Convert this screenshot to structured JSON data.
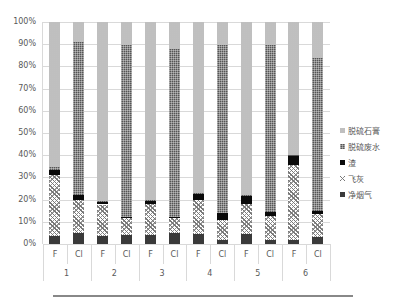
{
  "chart_data": {
    "type": "bar",
    "stacked": true,
    "percent": true,
    "title": "",
    "xlabel": "",
    "ylabel": "",
    "ylim": [
      0,
      100
    ],
    "y_ticks": [
      "0%",
      "10%",
      "20%",
      "30%",
      "40%",
      "50%",
      "60%",
      "70%",
      "80%",
      "90%",
      "100%"
    ],
    "grid": true,
    "legend_position": "right",
    "groups": [
      "1",
      "2",
      "3",
      "4",
      "5",
      "6"
    ],
    "categories": [
      "F",
      "Cl",
      "F",
      "Cl",
      "F",
      "Cl",
      "F",
      "Cl",
      "F",
      "Cl",
      "F",
      "Cl"
    ],
    "series": [
      {
        "name": "净烟气",
        "key": "gas",
        "values": [
          3.8,
          5.0,
          3.4,
          4.0,
          4.0,
          5.0,
          4.5,
          2.0,
          4.5,
          2.0,
          2.0,
          3.0
        ]
      },
      {
        "name": "飞灰",
        "key": "ash",
        "values": [
          27.2,
          15.0,
          14.4,
          7.5,
          14.0,
          6.5,
          15.5,
          9.0,
          13.5,
          10.7,
          33.5,
          10.5
        ]
      },
      {
        "name": "渣",
        "key": "slag",
        "values": [
          2.5,
          2.0,
          1.2,
          0.5,
          1.5,
          0.5,
          2.5,
          3.0,
          3.7,
          1.8,
          4.5,
          1.5
        ]
      },
      {
        "name": "脱硫废水",
        "key": "ww",
        "values": [
          1.0,
          69.0,
          0.5,
          77.5,
          0.5,
          76.0,
          0.5,
          75.5,
          0.3,
          75.0,
          0.3,
          69.0
        ]
      },
      {
        "name": "脱硫石膏",
        "key": "gyp",
        "values": [
          65.5,
          9.0,
          80.5,
          10.5,
          80.0,
          12.0,
          77.0,
          10.5,
          78.0,
          10.5,
          59.7,
          16.0
        ]
      }
    ]
  },
  "legend": [
    {
      "label": "脱硫石膏",
      "key": "gyp"
    },
    {
      "label": "脱硫废水",
      "key": "ww"
    },
    {
      "label": "渣",
      "key": "slag"
    },
    {
      "label": "飞灰",
      "key": "ash"
    },
    {
      "label": "净烟气",
      "key": "gas"
    }
  ]
}
